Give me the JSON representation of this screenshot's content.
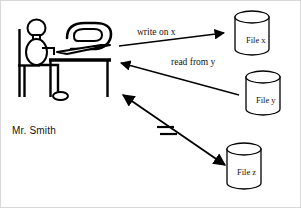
{
  "diagram": {
    "background_color": "#ffffff",
    "stroke_color": "#000000",
    "actor": {
      "label": "Mr. Smith",
      "icon": "person-at-desk-with-computer"
    },
    "data_stores": [
      {
        "id": "file-x",
        "label": "File x"
      },
      {
        "id": "file-y",
        "label": "File y"
      },
      {
        "id": "file-z",
        "label": "File z"
      }
    ],
    "edges": [
      {
        "id": "write-on-x",
        "label": "write on x",
        "from": "actor",
        "to": "file-x",
        "direction": "forward",
        "blocked": false
      },
      {
        "id": "read-from-y",
        "label": "read from y",
        "from": "file-y",
        "to": "actor",
        "direction": "forward",
        "blocked": false
      },
      {
        "id": "access-z",
        "label": "",
        "from": "actor",
        "to": "file-z",
        "direction": "bidirectional",
        "blocked": true,
        "blocked_marker": "double-hash-cut"
      }
    ]
  }
}
